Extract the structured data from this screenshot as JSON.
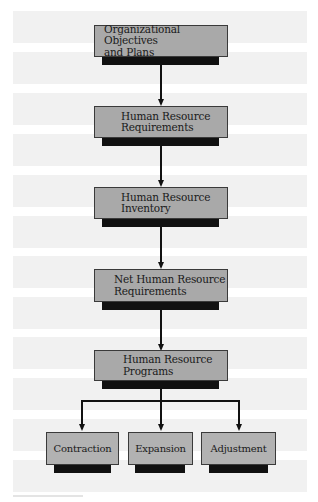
{
  "diagram": {
    "type": "flowchart",
    "nodes": [
      {
        "id": "n1",
        "label_lines": [
          "Organizational Objectives",
          "and Plans"
        ]
      },
      {
        "id": "n2",
        "label_lines": [
          "Human Resource",
          "Requirements"
        ]
      },
      {
        "id": "n3",
        "label_lines": [
          "Human Resource",
          "Inventory"
        ]
      },
      {
        "id": "n4",
        "label_lines": [
          "Net Human Resource",
          "Requirements"
        ]
      },
      {
        "id": "n5",
        "label_lines": [
          "Human Resource",
          "Programs"
        ]
      },
      {
        "id": "n6",
        "label": "Contraction"
      },
      {
        "id": "n7",
        "label": "Expansion"
      },
      {
        "id": "n8",
        "label": "Adjustment"
      }
    ],
    "edges": [
      [
        "n1",
        "n2"
      ],
      [
        "n2",
        "n3"
      ],
      [
        "n3",
        "n4"
      ],
      [
        "n4",
        "n5"
      ],
      [
        "n5",
        "n6"
      ],
      [
        "n5",
        "n7"
      ],
      [
        "n5",
        "n8"
      ]
    ],
    "colors": {
      "box_fill": "#a9a9a9",
      "small_box_fill": "#b2b2b2",
      "shadow": "#111111",
      "band": "#f1f1f1",
      "line": "#111111"
    }
  }
}
